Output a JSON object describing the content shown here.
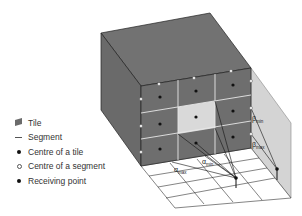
{
  "legend": {
    "items": [
      {
        "symbol": "tile-swatch",
        "label": "Tile"
      },
      {
        "symbol": "segment-line",
        "label": "Segment"
      },
      {
        "symbol": "filled-dot",
        "label": "Centre of a tile"
      },
      {
        "symbol": "open-dot",
        "label": "Centre of a segment"
      },
      {
        "symbol": "filled-dot",
        "label": "Receiving point"
      }
    ]
  },
  "labels": {
    "alpha": "α",
    "beta": "β",
    "min": "min",
    "max": "max"
  },
  "colors": {
    "block": "#6e6e6e",
    "block_edge": "#222222",
    "highlight_tile": "#d9d9d9",
    "plane": "#d4d4d4",
    "grid_line": "#e8e8e8",
    "ground_line": "#333333"
  }
}
